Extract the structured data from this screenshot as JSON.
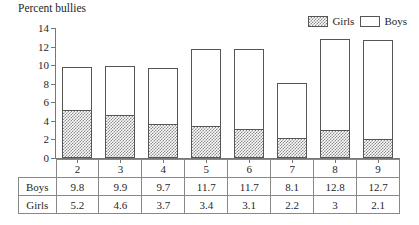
{
  "chart_data": {
    "type": "bar",
    "stacked": true,
    "title": "Percent bullies",
    "xlabel": "",
    "ylabel": "",
    "ylim": [
      0,
      14
    ],
    "ytick_step": 2,
    "yticks": [
      14,
      12,
      10,
      8,
      6,
      4,
      2,
      0
    ],
    "grid": false,
    "legend_position": "top-right",
    "categories": [
      "2",
      "3",
      "4",
      "5",
      "6",
      "7",
      "8",
      "9"
    ],
    "series": [
      {
        "name": "Girls",
        "swatch": "hatched",
        "values": [
          5.2,
          4.6,
          3.7,
          3.4,
          3.1,
          2.2,
          3,
          2.1
        ]
      },
      {
        "name": "Boys",
        "swatch": "outline",
        "values": [
          9.8,
          9.9,
          9.7,
          11.7,
          11.7,
          8.1,
          12.8,
          12.7
        ]
      }
    ],
    "note": "Each column is drawn as a single bar whose total height equals the Boys value; the hatched lower portion equals the Girls value."
  },
  "legend": {
    "entries": [
      {
        "label": "Girls",
        "style": "hatched"
      },
      {
        "label": "Boys",
        "style": "outline"
      }
    ]
  },
  "table": {
    "header": [
      "",
      "2",
      "3",
      "4",
      "5",
      "6",
      "7",
      "8",
      "9"
    ],
    "rows": [
      {
        "label": "Boys",
        "values": [
          "9.8",
          "9.9",
          "9.7",
          "11.7",
          "11.7",
          "8.1",
          "12.8",
          "12.7"
        ]
      },
      {
        "label": "Girls",
        "values": [
          "5.2",
          "4.6",
          "3.7",
          "3.4",
          "3.1",
          "2.2",
          "3",
          "2.1"
        ]
      }
    ]
  },
  "colors": {
    "axis": "#777777",
    "bar_outline": "#555555",
    "hatch": "#8a8a8a",
    "table_border": "#888888",
    "text": "#1f1f1f",
    "background": "#ffffff"
  }
}
